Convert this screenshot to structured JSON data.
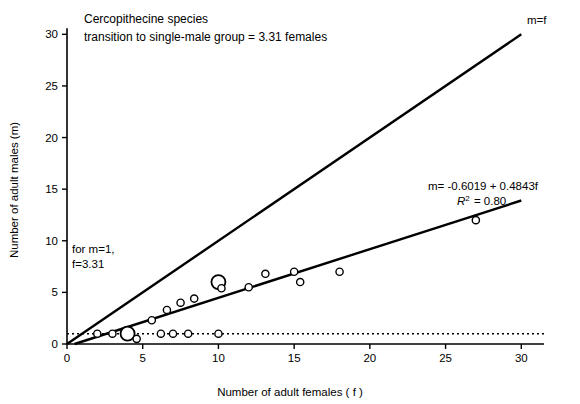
{
  "chart_data": {
    "type": "scatter",
    "title": "",
    "xlabel": "Number of adult females ( f )",
    "ylabel": "Number of adult males (m)",
    "xlim": [
      0,
      31.5
    ],
    "ylim": [
      0,
      31
    ],
    "xticks": [
      0,
      5,
      10,
      15,
      20,
      25,
      30
    ],
    "yticks": [
      0,
      5,
      10,
      15,
      20,
      25,
      30
    ],
    "grid": false,
    "legend": "none",
    "series": [
      {
        "name": "Cercopithecine species data points",
        "type": "scatter",
        "points": [
          {
            "x": 2.0,
            "y": 1.0,
            "size": "small"
          },
          {
            "x": 3.0,
            "y": 1.0,
            "size": "small"
          },
          {
            "x": 4.0,
            "y": 1.0,
            "size": "large"
          },
          {
            "x": 4.6,
            "y": 0.5,
            "size": "small"
          },
          {
            "x": 5.6,
            "y": 2.3,
            "size": "small"
          },
          {
            "x": 6.2,
            "y": 1.0,
            "size": "small"
          },
          {
            "x": 6.6,
            "y": 3.3,
            "size": "small"
          },
          {
            "x": 7.0,
            "y": 1.0,
            "size": "small"
          },
          {
            "x": 7.5,
            "y": 4.0,
            "size": "small"
          },
          {
            "x": 8.0,
            "y": 1.0,
            "size": "small"
          },
          {
            "x": 8.4,
            "y": 4.4,
            "size": "small"
          },
          {
            "x": 10.0,
            "y": 1.0,
            "size": "small"
          },
          {
            "x": 10.0,
            "y": 6.0,
            "size": "large"
          },
          {
            "x": 10.2,
            "y": 5.4,
            "size": "small"
          },
          {
            "x": 12.0,
            "y": 5.5,
            "size": "small"
          },
          {
            "x": 13.1,
            "y": 6.8,
            "size": "small"
          },
          {
            "x": 15.0,
            "y": 7.0,
            "size": "small"
          },
          {
            "x": 15.4,
            "y": 6.0,
            "size": "small"
          },
          {
            "x": 18.0,
            "y": 7.0,
            "size": "small"
          },
          {
            "x": 27.0,
            "y": 12.0,
            "size": "small"
          }
        ]
      },
      {
        "name": "m=f line",
        "type": "line",
        "x": [
          0,
          30
        ],
        "y": [
          0,
          30
        ]
      },
      {
        "name": "regression line",
        "type": "line",
        "equation": "m = -0.6019 + 0.4843f",
        "r_squared": 0.8,
        "x": [
          0.5,
          30
        ],
        "y": [
          0,
          13.9
        ]
      },
      {
        "name": "m=1 reference line",
        "type": "line",
        "style": "dotted",
        "x": [
          0,
          31.5
        ],
        "y": [
          1,
          1
        ]
      }
    ],
    "annotations": [
      {
        "name": "title-line-1",
        "text": "Cercopithecine species"
      },
      {
        "name": "title-line-2",
        "text": "transition to single-male group = 3.31 females"
      },
      {
        "name": "identity-line-label",
        "text": "m=f"
      },
      {
        "name": "regression-equation",
        "text": "m= -0.6019 + 0.4843f"
      },
      {
        "name": "r-squared-prefix",
        "text": "R"
      },
      {
        "name": "r-squared-value",
        "text": "2 = 0.80"
      },
      {
        "name": "transition-note-line-1",
        "text": "for m=1,"
      },
      {
        "name": "transition-note-line-2",
        "text": "f=3.31"
      }
    ]
  },
  "colors": {
    "axis": "#000000",
    "line": "#000000",
    "marker_stroke": "#000000",
    "marker_fill": "#ffffff",
    "background": "#ffffff"
  }
}
